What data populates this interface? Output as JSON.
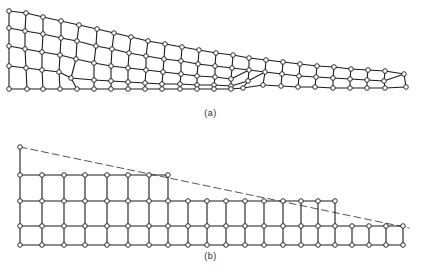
{
  "figure": {
    "width": 421,
    "height": 273,
    "background_color": "#ffffff",
    "line_color": "#1a1a1a",
    "node_fill_color": "#ffffff",
    "node_stroke_color": "#1a1a1a",
    "dashed_line_color": "#555555"
  },
  "panels": [
    {
      "id": "a",
      "caption": "(a)",
      "description": "Smoothed / graded quadrilateral mesh of a tapered wedge with irregular transition elements",
      "style": "graded-irregular",
      "has_dashed_boundary": false
    },
    {
      "id": "b",
      "caption": "(b)",
      "description": "Stair-stepped rectangular quadrilateral mesh of the same tapered wedge with dashed ideal boundary",
      "style": "stair-stepped",
      "has_dashed_boundary": true
    }
  ],
  "mesh_a": {
    "type": "quad-mesh",
    "node_radius": 2.3,
    "stroke_width": 1.1,
    "nodes": [
      [
        9,
        11
      ],
      [
        9,
        28
      ],
      [
        9,
        46
      ],
      [
        9,
        66
      ],
      [
        9,
        89
      ],
      [
        26,
        13
      ],
      [
        25,
        31
      ],
      [
        25,
        49
      ],
      [
        26,
        68
      ],
      [
        27,
        89
      ],
      [
        43,
        17
      ],
      [
        43,
        34
      ],
      [
        42,
        52
      ],
      [
        42,
        70
      ],
      [
        43,
        89
      ],
      [
        61,
        21
      ],
      [
        61,
        38
      ],
      [
        60,
        55
      ],
      [
        59,
        72
      ],
      [
        60,
        89
      ],
      [
        79,
        25
      ],
      [
        77,
        41
      ],
      [
        76,
        59
      ],
      [
        71,
        78
      ],
      [
        77,
        89
      ],
      [
        97,
        29
      ],
      [
        96,
        46
      ],
      [
        94,
        63
      ],
      [
        94,
        80
      ],
      [
        94,
        89
      ],
      [
        114,
        33
      ],
      [
        112,
        49
      ],
      [
        111,
        66
      ],
      [
        111,
        81
      ],
      [
        111,
        89
      ],
      [
        131,
        37
      ],
      [
        129,
        53
      ],
      [
        128,
        68
      ],
      [
        128,
        82
      ],
      [
        128,
        89
      ],
      [
        148,
        41
      ],
      [
        146,
        56
      ],
      [
        146,
        70
      ],
      [
        145,
        83
      ],
      [
        145,
        89
      ],
      [
        165,
        44
      ],
      [
        164,
        59
      ],
      [
        163,
        72
      ],
      [
        162,
        84
      ],
      [
        162,
        89
      ],
      [
        182,
        47
      ],
      [
        181,
        61
      ],
      [
        181,
        74
      ],
      [
        180,
        84
      ],
      [
        180,
        89
      ],
      [
        199,
        50
      ],
      [
        198,
        64
      ],
      [
        197,
        76
      ],
      [
        197,
        85
      ],
      [
        197,
        89
      ],
      [
        216,
        53
      ],
      [
        215,
        66
      ],
      [
        215,
        77
      ],
      [
        214,
        85
      ],
      [
        214,
        89
      ],
      [
        233,
        55
      ],
      [
        232,
        68
      ],
      [
        231,
        79
      ],
      [
        231,
        86
      ],
      [
        231,
        89
      ],
      [
        249,
        58
      ],
      [
        249,
        70
      ],
      [
        248,
        81
      ],
      [
        243,
        88
      ],
      [
        266,
        60
      ],
      [
        265,
        72
      ],
      [
        263,
        85
      ],
      [
        283,
        62
      ],
      [
        282,
        74
      ],
      [
        281,
        86
      ],
      [
        300,
        64
      ],
      [
        299,
        76
      ],
      [
        298,
        87
      ],
      [
        317,
        66
      ],
      [
        316,
        77
      ],
      [
        315,
        87
      ],
      [
        334,
        67
      ],
      [
        333,
        78
      ],
      [
        333,
        88
      ],
      [
        351,
        69
      ],
      [
        350,
        79
      ],
      [
        350,
        88
      ],
      [
        368,
        70
      ],
      [
        367,
        80
      ],
      [
        367,
        88
      ],
      [
        385,
        71
      ],
      [
        384,
        81
      ],
      [
        385,
        88
      ],
      [
        404,
        74
      ],
      [
        406,
        87
      ]
    ],
    "row_counts": [
      5,
      5,
      5,
      5,
      5,
      5,
      5,
      5,
      5,
      5,
      5,
      5,
      5,
      5,
      4,
      3,
      3,
      3,
      3,
      3,
      3,
      3,
      3,
      2
    ],
    "transition_columns": [
      4,
      14
    ],
    "taper_note": "Thickness decreases from 5 node-rows at left to 2 node-rows at right via two transition zones"
  },
  "mesh_b": {
    "type": "quad-mesh",
    "node_radius": 2.3,
    "stroke_width": 1.1,
    "row_y": [
      147,
      175,
      201,
      226,
      245
    ],
    "column_x": [
      20,
      42,
      64,
      85,
      107,
      128,
      149,
      168,
      188,
      207,
      226,
      245,
      264,
      283,
      301,
      318,
      335,
      352,
      369,
      386,
      403
    ],
    "row_extents": [
      {
        "row": "top-apex-node",
        "from_col": 0,
        "to_col": 0,
        "y": 147
      },
      {
        "row": "row-1",
        "from_col": 0,
        "to_col": 7,
        "y": 175
      },
      {
        "row": "row-2",
        "from_col": 0,
        "to_col": 16,
        "y": 201
      },
      {
        "row": "row-3",
        "from_col": 0,
        "to_col": 20,
        "y": 226
      },
      {
        "row": "row-4",
        "from_col": 0,
        "to_col": 20,
        "y": 245
      }
    ],
    "steps": [
      {
        "at_column": 7,
        "from_rows": 4,
        "to_rows": 3
      },
      {
        "at_column": 16,
        "from_rows": 3,
        "to_rows": 2
      }
    ],
    "dashed_line": {
      "from": [
        20,
        147
      ],
      "to": [
        409,
        228
      ],
      "dash_pattern": "7,4",
      "label": "ideal tapered boundary"
    }
  }
}
